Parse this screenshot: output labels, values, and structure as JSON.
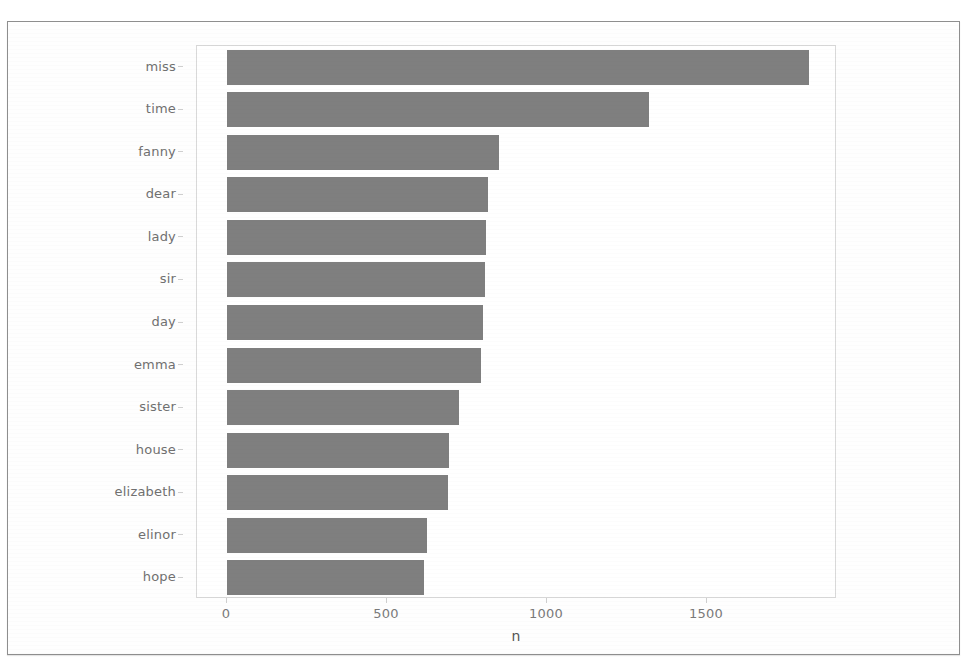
{
  "chart_data": {
    "type": "bar",
    "orientation": "horizontal",
    "title": "",
    "subtitle": "",
    "xlabel": "n",
    "ylabel": "",
    "categories": [
      "miss",
      "time",
      "fanny",
      "dear",
      "lady",
      "sir",
      "day",
      "emma",
      "sister",
      "house",
      "elizabeth",
      "elinor",
      "hope"
    ],
    "values": [
      1820,
      1320,
      850,
      815,
      810,
      805,
      800,
      795,
      725,
      695,
      690,
      625,
      615
    ],
    "series": [
      {
        "name": "n",
        "values": [
          1820,
          1320,
          850,
          815,
          810,
          805,
          800,
          795,
          725,
          695,
          690,
          625,
          615
        ]
      }
    ],
    "xlim": [
      0,
      2000
    ],
    "x_ticks": [
      0,
      500,
      1000,
      1500
    ],
    "x_tick_labels": [
      "0",
      "500",
      "1000",
      "1500"
    ],
    "y_tick_labels": [
      "miss",
      "time",
      "fanny",
      "dear",
      "lady",
      "sir",
      "day",
      "emma",
      "sister",
      "house",
      "elizabeth",
      "elinor",
      "hope"
    ],
    "grid": false,
    "legend": null,
    "legend_position": "none",
    "bar_color": "#7f7f7f",
    "panel_border_color": "#d9d9d9",
    "tick_label_color": "#707070",
    "axis_title_color": "#555555"
  },
  "figure": {
    "frame_color": "#8e8e8e",
    "background": "#ffffff"
  }
}
